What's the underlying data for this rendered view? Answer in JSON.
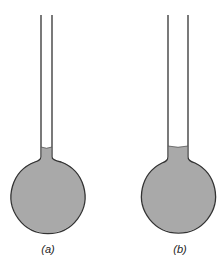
{
  "figure": {
    "colors": {
      "liquid": "#a9a9a9",
      "outline": "#333333",
      "background": "#ffffff"
    },
    "flasks": [
      {
        "id": "a",
        "label": "(a)",
        "tube_left": 41,
        "tube_right": 52,
        "liquid_top": 147,
        "bulb_cx": 48,
        "bulb_cy": 198,
        "bulb_r": 37
      },
      {
        "id": "b",
        "label": "(b)",
        "tube_left": 168,
        "tube_right": 188,
        "liquid_top": 146,
        "bulb_cx": 179,
        "bulb_cy": 199,
        "bulb_r": 37
      }
    ]
  }
}
